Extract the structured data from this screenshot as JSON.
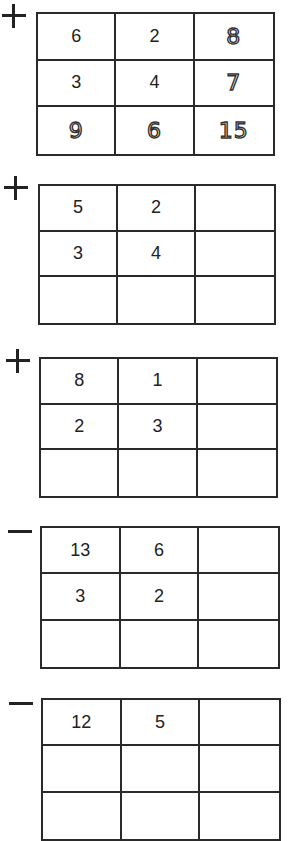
{
  "worksheet": {
    "problems": [
      {
        "operator": "+",
        "rows": [
          [
            "6",
            "2",
            "8"
          ],
          [
            "3",
            "4",
            "7"
          ],
          [
            "9",
            "6",
            "15"
          ]
        ],
        "answers_dotted": true
      },
      {
        "operator": "+",
        "rows": [
          [
            "5",
            "2",
            ""
          ],
          [
            "3",
            "4",
            ""
          ],
          [
            "",
            "",
            ""
          ]
        ]
      },
      {
        "operator": "+",
        "rows": [
          [
            "8",
            "1",
            ""
          ],
          [
            "2",
            "3",
            ""
          ],
          [
            "",
            "",
            ""
          ]
        ]
      },
      {
        "operator": "−",
        "rows": [
          [
            "13",
            "6",
            ""
          ],
          [
            "3",
            "2",
            ""
          ],
          [
            "",
            "",
            ""
          ]
        ]
      },
      {
        "operator": "−",
        "rows": [
          [
            "12",
            "5",
            ""
          ]
        ]
      }
    ]
  }
}
